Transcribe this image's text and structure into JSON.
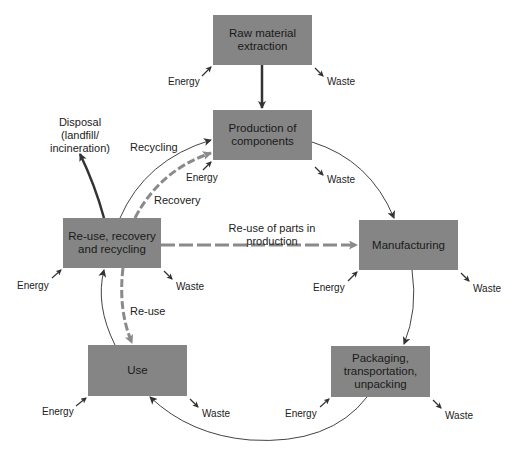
{
  "diagram": {
    "stages": {
      "raw": "Raw material extraction",
      "production": "Production of components",
      "reuse": "Re-use, recovery and recycling",
      "manufacturing": "Manufacturing",
      "use": "Use",
      "packaging": "Packaging, transportation, unpacking"
    },
    "inputs_outputs": {
      "energy": "Energy",
      "waste": "Waste"
    },
    "flows": {
      "disposal": "Disposal (landfill/ incineration)",
      "recycling": "Recycling",
      "recovery": "Recovery",
      "reuse_parts": "Re-use of parts in production",
      "reuse": "Re-use"
    },
    "colors": {
      "box_fill": "#858585",
      "solid_arrow": "#333333",
      "dashed_arrow": "#8a8a8a"
    }
  }
}
